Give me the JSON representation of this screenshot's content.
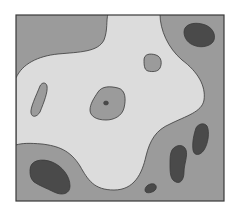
{
  "diagram": {
    "type": "filled-contour-regions",
    "colors": {
      "background": "#ffffff",
      "frame": "#3a3a3a",
      "level_mid": "#9b9b9b",
      "level_high": "#dcdcdc",
      "level_low": "#4a4a4a",
      "outline": "#3a3a3a"
    },
    "regions": [
      {
        "name": "outer-mid-region",
        "level": "mid"
      },
      {
        "name": "central-light-region",
        "level": "high"
      },
      {
        "name": "top-right-dark-blob",
        "level": "low"
      },
      {
        "name": "bottom-left-dark-blob",
        "level": "low"
      },
      {
        "name": "right-dark-blob-upper",
        "level": "low"
      },
      {
        "name": "right-dark-blob-lower",
        "level": "low"
      },
      {
        "name": "bottom-small-dark-blob",
        "level": "low"
      },
      {
        "name": "left-mid-island",
        "level": "mid"
      },
      {
        "name": "center-mid-island",
        "level": "mid"
      },
      {
        "name": "top-mid-island",
        "level": "mid"
      },
      {
        "name": "center-dark-dot",
        "level": "low"
      }
    ]
  }
}
